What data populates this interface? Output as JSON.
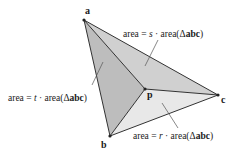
{
  "diagram": {
    "vertices": {
      "a": {
        "label": "a",
        "x": 84,
        "y": 20,
        "lx": 84,
        "ly": 14
      },
      "b": {
        "label": "b",
        "x": 110,
        "y": 136,
        "lx": 101,
        "ly": 148
      },
      "c": {
        "label": "c",
        "x": 218,
        "y": 95,
        "lx": 222,
        "ly": 103
      },
      "p": {
        "label": "p",
        "x": 145,
        "y": 89,
        "lx": 148,
        "ly": 99
      }
    },
    "regions": [
      {
        "name": "triangle-abp",
        "fill": "#bdbdbd"
      },
      {
        "name": "triangle-apc",
        "fill": "#d0d0d0"
      },
      {
        "name": "triangle-bpc",
        "fill": "#e8e8e8"
      }
    ],
    "labels": {
      "s": {
        "prefix": "area = ",
        "coef": "s",
        "mid": " · area(",
        "delta": "Δ",
        "tri": "abc",
        "suffix": ")"
      },
      "t": {
        "prefix": "area = ",
        "coef": "t",
        "mid": " · area(",
        "delta": "Δ",
        "tri": "abc",
        "suffix": ")"
      },
      "r": {
        "prefix": "area = ",
        "coef": "r",
        "mid": " · area(",
        "delta": "Δ",
        "tri": "abc",
        "suffix": ")"
      }
    },
    "stroke_color": "#333333"
  }
}
